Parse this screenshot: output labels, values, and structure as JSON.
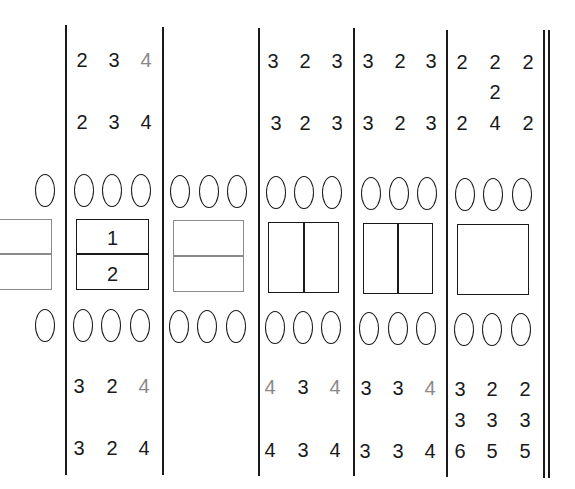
{
  "colors": {
    "ink": "#1a1a1a",
    "muted": "#8a8a8a",
    "background": "#ffffff"
  },
  "panels": [
    {
      "id": "p0",
      "top_rows": [],
      "bottom_rows": [],
      "box": "partial-split-gray"
    },
    {
      "id": "p1",
      "top_rows": [
        [
          "2",
          "3",
          "4"
        ],
        [
          "2",
          "3",
          "4"
        ]
      ],
      "top_gray": [
        [
          false,
          false,
          true
        ],
        [
          false,
          false,
          false
        ]
      ],
      "box": "horizontal-split",
      "box_labels": [
        "1",
        "2"
      ],
      "bottom_rows": [
        [
          "3",
          "2",
          "4"
        ],
        [
          "3",
          "2",
          "4"
        ]
      ],
      "bottom_gray": [
        [
          false,
          false,
          true
        ],
        [
          false,
          false,
          false
        ]
      ]
    },
    {
      "id": "p2",
      "top_rows": [],
      "bottom_rows": [],
      "box": "horizontal-split-gray"
    },
    {
      "id": "p3",
      "top_rows": [
        [
          "3",
          "2",
          "3"
        ],
        [
          "3",
          "2",
          "3"
        ]
      ],
      "box": "vertical-split",
      "bottom_rows": [
        [
          "4",
          "3",
          "4"
        ],
        [
          "4",
          "3",
          "4"
        ]
      ],
      "bottom_gray": [
        [
          true,
          false,
          true
        ],
        [
          false,
          false,
          false
        ]
      ]
    },
    {
      "id": "p4",
      "top_rows": [
        [
          "3",
          "2",
          "3"
        ],
        [
          "3",
          "2",
          "3"
        ]
      ],
      "box": "vertical-split",
      "bottom_rows": [
        [
          "3",
          "3",
          "4"
        ],
        [
          "3",
          "3",
          "4"
        ]
      ],
      "bottom_gray": [
        [
          false,
          false,
          true
        ],
        [
          false,
          false,
          false
        ]
      ]
    },
    {
      "id": "p5",
      "top_rows": [
        [
          "2",
          "2",
          "2"
        ],
        [
          "",
          "2",
          ""
        ],
        [
          "2",
          "4",
          "2"
        ]
      ],
      "box": "plain",
      "bottom_rows": [
        [
          "3",
          "2",
          "2"
        ],
        [
          "3",
          "3",
          "3"
        ],
        [
          "6",
          "5",
          "5"
        ]
      ]
    }
  ],
  "t": {
    "p1": {
      "r0": [
        "2",
        "3",
        "4"
      ],
      "r1": [
        "2",
        "3",
        "4"
      ],
      "box1": "1",
      "box2": "2",
      "b0": [
        "3",
        "2",
        "4"
      ],
      "b1": [
        "3",
        "2",
        "4"
      ]
    },
    "p3": {
      "r0": [
        "3",
        "2",
        "3"
      ],
      "r1": [
        "3",
        "2",
        "3"
      ],
      "b0": [
        "4",
        "3",
        "4"
      ],
      "b1": [
        "4",
        "3",
        "4"
      ]
    },
    "p4": {
      "r0": [
        "3",
        "2",
        "3"
      ],
      "r1": [
        "3",
        "2",
        "3"
      ],
      "b0": [
        "3",
        "3",
        "4"
      ],
      "b1": [
        "3",
        "3",
        "4"
      ]
    },
    "p5": {
      "r0": [
        "2",
        "2",
        "2"
      ],
      "rmid": "2",
      "r1": [
        "2",
        "4",
        "2"
      ],
      "b0": [
        "3",
        "2",
        "2"
      ],
      "b1": [
        "3",
        "3",
        "3"
      ],
      "b2": [
        "6",
        "5",
        "5"
      ]
    }
  }
}
